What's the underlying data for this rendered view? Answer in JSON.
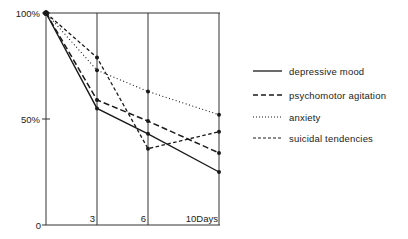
{
  "chart_data": {
    "type": "line",
    "title": "",
    "xlabel": "Days",
    "ylabel": "%",
    "x": [
      0,
      3,
      6,
      10
    ],
    "x_ticks": [
      "3",
      "6",
      "10Days"
    ],
    "y_ticks": [
      "0",
      "50%",
      "100%"
    ],
    "ylim": [
      0,
      100
    ],
    "xlim": [
      0,
      10
    ],
    "grid": "vertical lines at days 3, 6, 10",
    "legend_position": "right",
    "series": [
      {
        "name": "depressive mood",
        "style": "solid",
        "values": [
          100,
          55,
          43,
          25
        ]
      },
      {
        "name": "psychomotor agitation",
        "style": "long-dash",
        "values": [
          100,
          59,
          49,
          34
        ]
      },
      {
        "name": "anxiety",
        "style": "dotted",
        "values": [
          100,
          73,
          63,
          52
        ]
      },
      {
        "name": "suicidal tendencies",
        "style": "short-dash",
        "values": [
          100,
          79,
          36,
          44
        ]
      }
    ]
  },
  "axis": {
    "y_label_0": "0",
    "y_label_50": "50%",
    "y_label_100": "100%",
    "x_label_3": "3",
    "x_label_6": "6",
    "x_label_10": "10Days"
  },
  "legend": {
    "items": [
      {
        "label": "depressive mood"
      },
      {
        "label": "psychomotor agitation"
      },
      {
        "label": "anxiety"
      },
      {
        "label": "suicidal tendencies"
      }
    ]
  },
  "colors": {
    "line": "#1a1a1a",
    "axis": "#333333",
    "background": "#ffffff"
  }
}
